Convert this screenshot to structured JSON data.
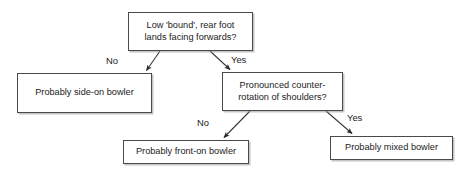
{
  "diagram": {
    "background_color": "#ffffff",
    "line_color": "#3a3a3a",
    "box_border_color": "#4a4a4a",
    "text_color": "#1b1b1b",
    "nodes": [
      {
        "id": "root",
        "kind": "decision",
        "text": "Low 'bound', rear foot\nlands facing forwards?"
      },
      {
        "id": "side-on",
        "kind": "outcome",
        "text": "Probably side-on bowler"
      },
      {
        "id": "counter-rotation",
        "kind": "decision",
        "text": "Pronounced counter-\nrotation of shoulders?"
      },
      {
        "id": "front-on",
        "kind": "outcome",
        "text": "Probably front-on bowler"
      },
      {
        "id": "mixed",
        "kind": "outcome",
        "text": "Probably mixed bowler"
      }
    ],
    "edges": [
      {
        "id": "root-no",
        "from": "root",
        "to": "side-on",
        "label": "No"
      },
      {
        "id": "root-yes",
        "from": "root",
        "to": "counter-rotation",
        "label": "Yes"
      },
      {
        "id": "counter-no",
        "from": "counter-rotation",
        "to": "front-on",
        "label": "No"
      },
      {
        "id": "counter-yes",
        "from": "counter-rotation",
        "to": "mixed",
        "label": "Yes"
      }
    ]
  }
}
